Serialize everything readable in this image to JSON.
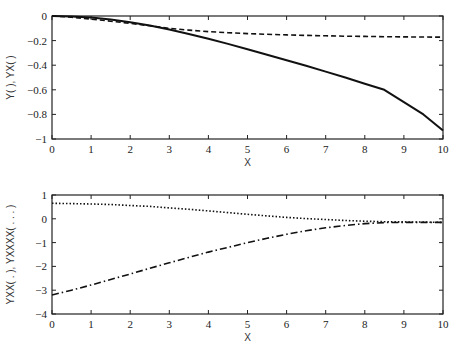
{
  "chart_data": [
    {
      "type": "line",
      "title": "",
      "xlabel": "X",
      "ylabel": "Y(  ), YX(  )",
      "xlim": [
        0,
        10
      ],
      "ylim": [
        -1,
        0
      ],
      "xticks": [
        "0",
        "1",
        "2",
        "3",
        "4",
        "5",
        "6",
        "7",
        "8",
        "9",
        "10"
      ],
      "yticks": [
        "0",
        "-0.2",
        "-0.4",
        "-0.6",
        "-0.8",
        "-1"
      ],
      "grid": false,
      "legend": null,
      "x": [
        0,
        0.5,
        1,
        1.5,
        2,
        2.5,
        3,
        3.5,
        4,
        4.5,
        5,
        5.5,
        6,
        6.5,
        7,
        7.5,
        8,
        8.5,
        9,
        9.5,
        10
      ],
      "series": [
        {
          "name": "Y",
          "style": "solid",
          "values": [
            0,
            -0.003,
            -0.012,
            -0.028,
            -0.05,
            -0.078,
            -0.11,
            -0.146,
            -0.185,
            -0.227,
            -0.27,
            -0.315,
            -0.36,
            -0.405,
            -0.452,
            -0.5,
            -0.55,
            -0.6,
            -0.7,
            -0.8,
            -0.93
          ]
        },
        {
          "name": "YX",
          "style": "dashed",
          "values": [
            0,
            -0.01,
            -0.025,
            -0.042,
            -0.06,
            -0.08,
            -0.1,
            -0.115,
            -0.127,
            -0.136,
            -0.143,
            -0.149,
            -0.154,
            -0.158,
            -0.161,
            -0.164,
            -0.166,
            -0.168,
            -0.17,
            -0.171,
            -0.172
          ]
        }
      ]
    },
    {
      "type": "line",
      "title": "",
      "xlabel": "X",
      "ylabel": "YXX(  .  ), YXXXX( . . . )",
      "xlim": [
        0,
        10
      ],
      "ylim": [
        -4,
        1
      ],
      "xticks": [
        "0",
        "1",
        "2",
        "3",
        "4",
        "5",
        "6",
        "7",
        "8",
        "9",
        "10"
      ],
      "yticks": [
        "1",
        "0",
        "-1",
        "-2",
        "-3",
        "-4"
      ],
      "grid": false,
      "legend": null,
      "x": [
        0,
        0.5,
        1,
        1.5,
        2,
        2.5,
        3,
        3.5,
        4,
        4.5,
        5,
        5.5,
        6,
        6.5,
        7,
        7.5,
        8,
        8.5,
        9,
        9.5,
        10
      ],
      "series": [
        {
          "name": "YXX",
          "style": "dotted",
          "values": [
            0.65,
            0.64,
            0.62,
            0.6,
            0.56,
            0.52,
            0.46,
            0.4,
            0.33,
            0.26,
            0.19,
            0.12,
            0.06,
            0.01,
            -0.03,
            -0.07,
            -0.1,
            -0.12,
            -0.13,
            -0.14,
            -0.15
          ]
        },
        {
          "name": "YXXXX",
          "style": "dashdot",
          "values": [
            -3.2,
            -3.0,
            -2.78,
            -2.55,
            -2.32,
            -2.08,
            -1.85,
            -1.62,
            -1.4,
            -1.2,
            -1.0,
            -0.82,
            -0.65,
            -0.5,
            -0.38,
            -0.28,
            -0.2,
            -0.16,
            -0.15,
            -0.15,
            -0.15
          ]
        }
      ]
    }
  ],
  "plots": {
    "top": {
      "xlabel": "X",
      "ylabel": "Y(  ), YX(  )",
      "xticks": [
        "0",
        "1",
        "2",
        "3",
        "4",
        "5",
        "6",
        "7",
        "8",
        "9",
        "10"
      ],
      "yticks": [
        "0",
        "-0.2",
        "-0.4",
        "-0.6",
        "-0.8",
        "-1"
      ]
    },
    "bottom": {
      "xlabel": "X",
      "ylabel": "YXX(  .  ), YXXXX( . . . )",
      "xticks": [
        "0",
        "1",
        "2",
        "3",
        "4",
        "5",
        "6",
        "7",
        "8",
        "9",
        "10"
      ],
      "yticks": [
        "1",
        "0",
        "-1",
        "-2",
        "-3",
        "-4"
      ]
    }
  },
  "colors": {
    "line": "#111111",
    "frame": "#222222",
    "background": "#ffffff"
  }
}
